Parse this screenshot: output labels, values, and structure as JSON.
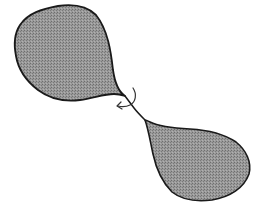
{
  "diagram": {
    "colors": {
      "background": "#ffffff",
      "outline": "#1a1a1a",
      "fill_base": "#9a9a9a",
      "fill_dot": "#6e6e6e"
    },
    "elements": [
      {
        "id": "upper-lobe",
        "label": "upper teardrop lobe"
      },
      {
        "id": "neck",
        "label": "twisted connecting neck"
      },
      {
        "id": "rotation-arrow",
        "label": "curved arrow indicating twist"
      },
      {
        "id": "lower-lobe",
        "label": "lower teardrop lobe"
      }
    ]
  }
}
